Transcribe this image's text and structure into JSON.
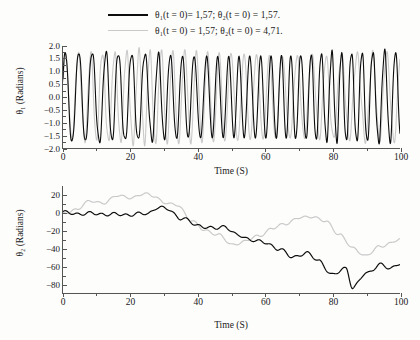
{
  "figure": {
    "background": "#fdfdfc",
    "series_colors": {
      "series1": "#0d0d0d",
      "series2": "#c9c9c9"
    }
  },
  "legend": {
    "position": "top-center",
    "entries": [
      {
        "label": "θ₁(t = 0)= 1,57; θ₂(t = 0) = 1,57.",
        "color": "#0d0d0d",
        "style": "solid-thick"
      },
      {
        "label": "θ₁(t = 0) = 1,57; θ₂(t = 0) = 4,71.",
        "color": "#c9c9c9",
        "style": "solid-thin"
      }
    ]
  },
  "chart_data": [
    {
      "id": "theta1-panel",
      "type": "line",
      "title": "",
      "xlabel": "Time (S)",
      "ylabel": "θ₁ (Radians)",
      "xlim": [
        0,
        100
      ],
      "ylim": [
        -2.0,
        2.0
      ],
      "xticks": [
        0,
        20,
        40,
        60,
        80,
        100
      ],
      "xtick_labels": [
        "0",
        "20",
        "40",
        "60",
        "80",
        "100"
      ],
      "xminor_step": 10,
      "yticks": [
        2.0,
        1.5,
        1.0,
        0.5,
        0.0,
        -0.5,
        -1.0,
        -1.5,
        -2.0
      ],
      "ytick_labels": [
        "2.0",
        "1.5",
        "1.0",
        "0.5",
        "0.0",
        "−0.5",
        "−1.0",
        "−1.5",
        "−2.0"
      ],
      "grid": false,
      "legend_position": "above-figure",
      "series": [
        {
          "name": "θ₁(t = 0)= 1,57; θ₂(t = 0) = 1,57.",
          "color": "#0d0d0d",
          "description": "Dense oscillation, amplitude about ±1.7 radians, period near 3.6 s, persisting over the whole 100 s window.",
          "amplitude": 1.7,
          "period": 3.6,
          "phase": 0.0
        },
        {
          "name": "θ₁(t = 0) = 1,57; θ₂(t = 0) = 4,71.",
          "color": "#c9c9c9",
          "description": "Nearly identical oscillation early on; progressively drifts out of phase after t ≈ 45 s, amplitude about ±1.7 radians.",
          "amplitude": 1.7,
          "period": 3.75,
          "phase": 0.35
        }
      ]
    },
    {
      "id": "theta2-panel",
      "type": "line",
      "title": "",
      "xlabel": "Time (S)",
      "ylabel": "θ₂ (Radians)",
      "xlim": [
        0,
        100
      ],
      "ylim": [
        -90,
        30
      ],
      "xticks": [
        0,
        20,
        40,
        60,
        80,
        100
      ],
      "xtick_labels": [
        "0",
        "20",
        "40",
        "60",
        "80",
        "100"
      ],
      "xminor_step": 10,
      "yticks": [
        20,
        0,
        -20,
        -40,
        -60,
        -80
      ],
      "ytick_labels": [
        "20",
        "0",
        "−20",
        "−40",
        "−60",
        "−80"
      ],
      "grid": false,
      "series": [
        {
          "name": "θ₁(t = 0)= 1,57; θ₂(t = 0) = 1,57.",
          "color": "#0d0d0d",
          "x": [
            0,
            5,
            10,
            15,
            20,
            25,
            28,
            31,
            35,
            40,
            45,
            48,
            52,
            56,
            60,
            64,
            68,
            72,
            76,
            80,
            84,
            86,
            90,
            94,
            97,
            100
          ],
          "y": [
            0,
            -1,
            -1,
            -2,
            -2,
            -1,
            6,
            4,
            -6,
            -14,
            -18,
            -15,
            -26,
            -30,
            -34,
            -40,
            -50,
            -45,
            -54,
            -70,
            -62,
            -84,
            -68,
            -58,
            -63,
            -56
          ]
        },
        {
          "name": "θ₁(t = 0) = 1,57; θ₂(t = 0) = 4,71.",
          "color": "#c9c9c9",
          "x": [
            0,
            4,
            8,
            12,
            16,
            20,
            24,
            27,
            30,
            34,
            38,
            42,
            46,
            50,
            54,
            58,
            62,
            66,
            70,
            74,
            78,
            82,
            86,
            90,
            94,
            97,
            100
          ],
          "y": [
            0,
            3,
            14,
            10,
            20,
            16,
            22,
            18,
            12,
            8,
            -8,
            -20,
            -24,
            -36,
            -32,
            -26,
            -18,
            -12,
            -6,
            -4,
            -10,
            -24,
            -40,
            -48,
            -38,
            -34,
            -30
          ]
        }
      ]
    }
  ]
}
